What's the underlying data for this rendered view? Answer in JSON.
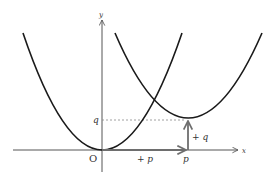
{
  "diagram": {
    "axes": {
      "x_label": "x",
      "y_label": "y",
      "origin_label": "O"
    },
    "curves": [
      {
        "name": "original-parabola",
        "vertex_label": "O"
      },
      {
        "name": "translated-parabola",
        "vertex_label": "(p, q)"
      }
    ],
    "annotations": {
      "q_axis_label": "q",
      "p_axis_label": "p",
      "horizontal_shift_label": "+ p",
      "vertical_shift_label": "+ q"
    },
    "colors": {
      "curve": "#1a1a1a",
      "axis": "#555555",
      "arrow": "#6e6e6e",
      "dashed": "#888888"
    }
  }
}
